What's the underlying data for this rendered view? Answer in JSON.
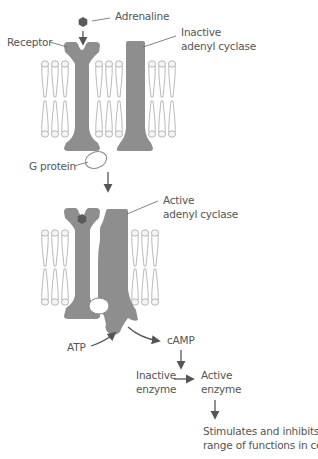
{
  "diagram": {
    "colors": {
      "protein": "#8e8e8e",
      "adrenaline": "#5a5a5a",
      "lipid_outline": "#9a9a9a",
      "arrow": "#555555",
      "text": "#555555"
    },
    "labels": {
      "adrenaline": "Adrenaline",
      "receptor": "Receptor",
      "inactive_adenyl_cyclase_1": "Inactive",
      "inactive_adenyl_cyclase_2": "adenyl cyclase",
      "g_protein": "G protein",
      "active_adenyl_cyclase_1": "Active",
      "active_adenyl_cyclase_2": "adenyl cyclase",
      "atp": "ATP",
      "camp": "cAMP",
      "inactive_enzyme_1": "Inactive",
      "inactive_enzyme_2": "enzyme",
      "active_enzyme_1": "Active",
      "active_enzyme_2": "enzyme",
      "outcome_1": "Stimulates and inhibits a",
      "outcome_2": "range of functions in cells"
    },
    "stages": [
      {
        "name": "before-binding",
        "description": "Adrenaline approaches receptor; adenyl cyclase inactive"
      },
      {
        "name": "after-binding",
        "description": "Adrenaline bound; G protein activates adenyl cyclase"
      }
    ],
    "flow": [
      "ATP -> cAMP",
      "cAMP -> Inactive enzyme -> Active enzyme",
      "Active enzyme -> Stimulates and inhibits a range of functions in cells"
    ]
  }
}
